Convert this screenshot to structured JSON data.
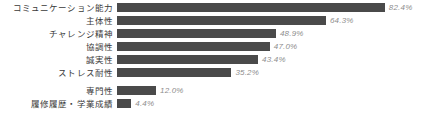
{
  "chart_data": {
    "type": "bar",
    "orientation": "horizontal",
    "title": "",
    "xlabel": "",
    "ylabel": "",
    "xlim": [
      0,
      100
    ],
    "grid": false,
    "legend": false,
    "categories": [
      "コミュニケーション能力",
      "主体性",
      "チャレンジ精神",
      "協調性",
      "誠実性",
      "ストレス耐性",
      "専門性",
      "履修履歴・学業成績"
    ],
    "values": [
      82.4,
      64.3,
      48.9,
      47.0,
      43.4,
      35.2,
      12.0,
      4.4
    ],
    "value_labels": [
      "82.4%",
      "64.3%",
      "48.9%",
      "47.0%",
      "43.4%",
      "35.2%",
      "12.0%",
      "4.4%"
    ],
    "group_gap_after_index": 5,
    "colors": {
      "bar": "#4a4a4a",
      "value_label": "#8d8d8d",
      "category_label": "#3a3a3a",
      "background": "#ffffff"
    }
  },
  "layout": {
    "bar_origin_x": 117,
    "px_per_percent": 3.25,
    "bar_height": 9,
    "row_pitch": 13,
    "group_gap": 18
  }
}
